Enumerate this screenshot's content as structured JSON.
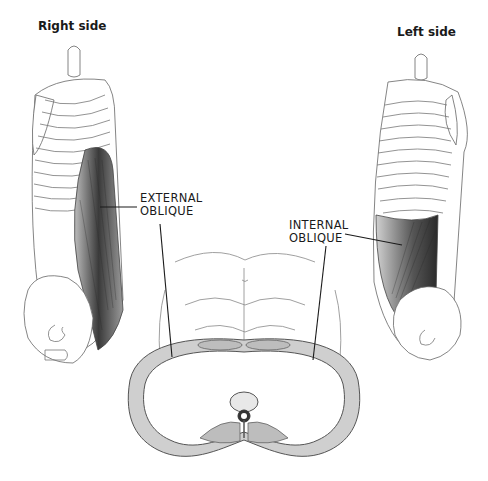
{
  "figure": {
    "title_left": "Right side",
    "title_right": "Left side",
    "labels": {
      "external_line1": "EXTERNAL",
      "external_line2": "OBLIQUE",
      "internal_line1": "INTERNAL",
      "internal_line2": "OBLIQUE"
    },
    "colors": {
      "background": "#ffffff",
      "ink": "#1a1a1a",
      "muscle_shade": "#3a3a3a",
      "line": "#555555"
    }
  }
}
